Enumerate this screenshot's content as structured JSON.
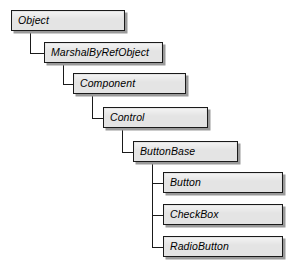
{
  "diagram": {
    "type": "class-inheritance-hierarchy",
    "title": "",
    "box_fill_color": "#e4e4e4",
    "box_border_color": "#1a1a1a",
    "box_shadow_color": "#9a9a9a",
    "connector_color": "#1a1a1a",
    "background_color": "#ffffff",
    "nodes": [
      {
        "id": "object",
        "label": "Object",
        "level": 0,
        "x": 11,
        "y": 10,
        "width": 114,
        "parent": null
      },
      {
        "id": "marshalbyrefobject",
        "label": "MarshalByRefObject",
        "level": 1,
        "x": 44,
        "y": 42,
        "width": 119,
        "parent": "object"
      },
      {
        "id": "component",
        "label": "Component",
        "level": 2,
        "x": 73,
        "y": 73,
        "width": 113,
        "parent": "marshalbyrefobject"
      },
      {
        "id": "control",
        "label": "Control",
        "level": 3,
        "x": 103,
        "y": 107,
        "width": 105,
        "parent": "component"
      },
      {
        "id": "buttonbase",
        "label": "ButtonBase",
        "level": 4,
        "x": 133,
        "y": 141,
        "width": 105,
        "parent": "control"
      },
      {
        "id": "button",
        "label": "Button",
        "level": 5,
        "x": 163,
        "y": 172,
        "width": 120,
        "parent": "buttonbase"
      },
      {
        "id": "checkbox",
        "label": "CheckBox",
        "level": 5,
        "x": 163,
        "y": 204,
        "width": 120,
        "parent": "buttonbase"
      },
      {
        "id": "radiobutton",
        "label": "RadioButton",
        "level": 5,
        "x": 163,
        "y": 236,
        "width": 120,
        "parent": "buttonbase"
      }
    ],
    "edges": [
      {
        "from": "object",
        "to": "marshalbyrefobject"
      },
      {
        "from": "marshalbyrefobject",
        "to": "component"
      },
      {
        "from": "component",
        "to": "control"
      },
      {
        "from": "control",
        "to": "buttonbase"
      },
      {
        "from": "buttonbase",
        "to": "button"
      },
      {
        "from": "buttonbase",
        "to": "checkbox"
      },
      {
        "from": "buttonbase",
        "to": "radiobutton"
      }
    ]
  }
}
